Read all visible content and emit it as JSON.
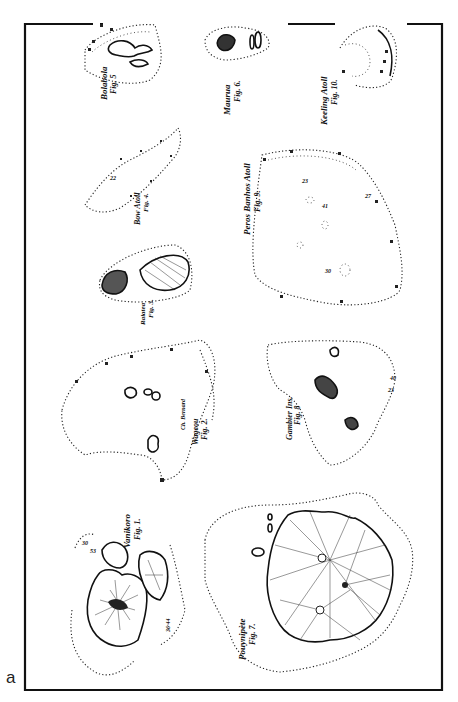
{
  "panel_label": "a",
  "figure": {
    "frame_color": "#111111",
    "background": "#ffffff",
    "orientation": "rotated-90-ccw",
    "maps": [
      {
        "fig": "Fig. 1",
        "name": "Vanikoro",
        "label": "Vanikoro",
        "fig_label": "Fig. 1.",
        "depth_marks": [
          "30",
          "53",
          "36·44",
          "20"
        ]
      },
      {
        "fig": "Fig. 2",
        "name": "Wageou",
        "label": "Wageou",
        "fig_label": "Fig. 2.",
        "extra_label": "Ch. Bernard"
      },
      {
        "fig": "Fig. 3",
        "name": "Raiatea",
        "label": "Raiatea",
        "fig_label": "Fig. 3."
      },
      {
        "fig": "Fig. 4",
        "name": "Bow Atoll",
        "label": "Bow Atoll",
        "fig_label": "Fig. 4.",
        "depth_marks": [
          "22"
        ]
      },
      {
        "fig": "Fig. 5",
        "name": "Bolabola",
        "label": "Bolabola",
        "fig_label": "Fig. 5"
      },
      {
        "fig": "Fig. 6",
        "name": "Maurua",
        "label": "Maurua",
        "fig_label": "Fig. 6."
      },
      {
        "fig": "Fig. 7",
        "name": "Pouynipète",
        "label": "Pouynipète",
        "fig_label": "Fig. 7."
      },
      {
        "fig": "Fig. 8",
        "name": "Gambier Ins.",
        "label": "Gambier Ins.",
        "fig_label": "Fig. 8",
        "depth_marks": [
          "23",
          "40"
        ]
      },
      {
        "fig": "Fig. 9",
        "name": "Peros Banhos Atoll",
        "label": "Peros Banhos Atoll",
        "fig_label": "Fig. 9.",
        "depth_marks": [
          "23",
          "41",
          "30",
          "27",
          "40"
        ]
      },
      {
        "fig": "Fig. 10",
        "name": "Keeling Atoll",
        "label": "Keeling Atoll",
        "fig_label": "Fig. 10."
      }
    ]
  }
}
